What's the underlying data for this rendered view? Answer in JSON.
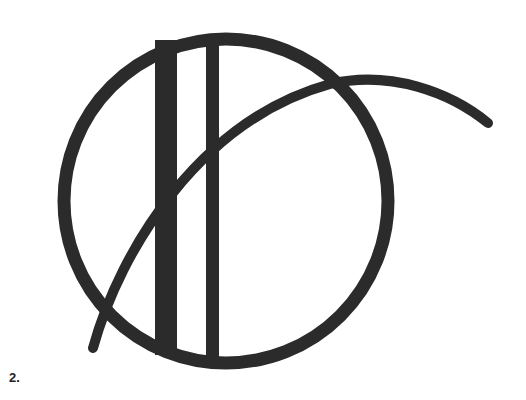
{
  "figure": {
    "label": "2.",
    "ink_color": "#2b2b2b",
    "background": "#ffffff",
    "elements": [
      {
        "name": "ring",
        "shape": "circle",
        "cx": 226,
        "cy": 201,
        "r": 162,
        "stroke_width": 13
      },
      {
        "name": "thick-bar",
        "shape": "rect",
        "x": 155,
        "y": 40,
        "width": 22,
        "height": 315
      },
      {
        "name": "thin-bar",
        "shape": "rect",
        "x": 206,
        "y": 34,
        "width": 13,
        "height": 328
      },
      {
        "name": "sweeping-arc",
        "shape": "path",
        "stroke_width": 10
      }
    ]
  }
}
